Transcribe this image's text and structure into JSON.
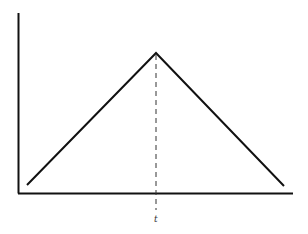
{
  "diagram": {
    "type": "triangular-pulse",
    "axes": {
      "x_axis_label": "",
      "y_axis_label": ""
    },
    "marker": {
      "label": "t",
      "style": "dashed vertical line through peak"
    },
    "colors": {
      "line": "#111111",
      "axis": "#111111",
      "dashed": "#333333",
      "background": "#ffffff"
    }
  }
}
